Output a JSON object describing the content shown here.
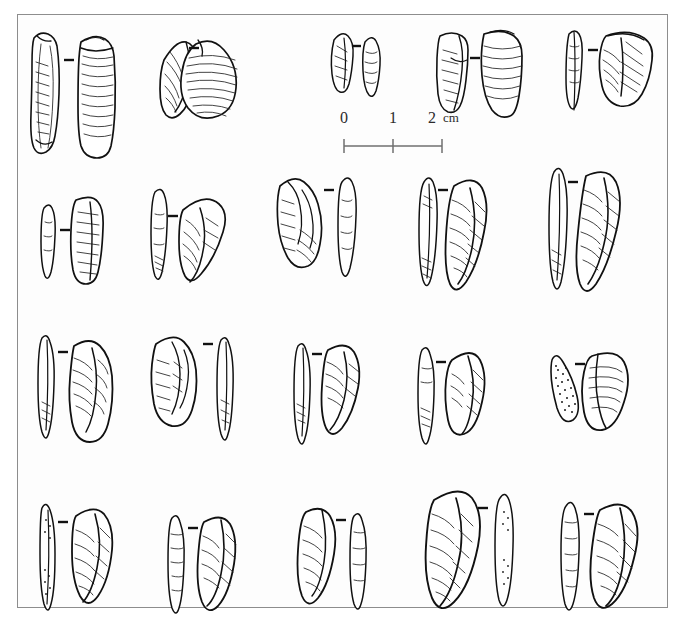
{
  "figure": {
    "type": "archaeological-lithic-plate",
    "title": "",
    "caption": "",
    "background_color": "#ffffff",
    "frame_color": "#8d8d8d",
    "ink_color": "#111111",
    "view_separator_glyph": "–",
    "rows": 4
  },
  "scale_bar": {
    "labels": [
      "0",
      "1",
      "2"
    ],
    "unit": "cm",
    "total_cm": 2,
    "tick_count": 3,
    "orientation": "horizontal"
  },
  "artifacts": [
    {
      "row": 1,
      "index": 1,
      "name": "blade-core-fragment",
      "views": [
        "lateral",
        "dorsal"
      ],
      "separator": "–",
      "texture": [
        "ripple-hatching",
        "retouch-scars"
      ]
    },
    {
      "row": 1,
      "index": 2,
      "name": "broad-flake",
      "views": [
        "lateral",
        "ventral"
      ],
      "separator": "–",
      "texture": [
        "concentric-ripples",
        "dorsal-ridges"
      ]
    },
    {
      "row": 1,
      "index": 3,
      "name": "small-flake",
      "views": [
        "dorsal",
        "profile"
      ],
      "separator": "–",
      "texture": [
        "fine-hatching"
      ]
    },
    {
      "row": 1,
      "index": 4,
      "name": "rectangular-flake",
      "views": [
        "dorsal",
        "ventral"
      ],
      "separator": "–",
      "texture": [
        "horizontal-ripples",
        "platform-scar"
      ]
    },
    {
      "row": 1,
      "index": 5,
      "name": "backed-flake",
      "views": [
        "profile",
        "dorsal"
      ],
      "separator": "–",
      "texture": [
        "radial-hatching",
        "retouch-edge"
      ]
    },
    {
      "row": 2,
      "index": 1,
      "name": "narrow-bladelet",
      "views": [
        "profile",
        "dorsal"
      ],
      "separator": "–",
      "texture": [
        "lateral-hatching"
      ]
    },
    {
      "row": 2,
      "index": 2,
      "name": "triangular-point",
      "views": [
        "profile",
        "dorsal"
      ],
      "separator": "–",
      "texture": [
        "cortex-stipple",
        "ridge-hatching"
      ]
    },
    {
      "row": 2,
      "index": 3,
      "name": "stepped-flake",
      "views": [
        "dorsal",
        "profile"
      ],
      "separator": "–",
      "texture": [
        "step-fracture",
        "ripple-hatching"
      ]
    },
    {
      "row": 2,
      "index": 4,
      "name": "curved-backed-blade",
      "views": [
        "profile",
        "dorsal"
      ],
      "separator": "–",
      "texture": [
        "fine-hatching",
        "backing-retouch"
      ]
    },
    {
      "row": 2,
      "index": 5,
      "name": "elongated-backed-blade",
      "views": [
        "profile",
        "dorsal"
      ],
      "separator": "–",
      "texture": [
        "dense-hatching",
        "backing-retouch"
      ]
    },
    {
      "row": 3,
      "index": 1,
      "name": "pointed-blade",
      "views": [
        "profile",
        "dorsal"
      ],
      "separator": "–",
      "texture": [
        "ridge-hatching",
        "cortex-stipple"
      ]
    },
    {
      "row": 3,
      "index": 2,
      "name": "angular-flake",
      "views": [
        "dorsal",
        "profile"
      ],
      "separator": "–",
      "texture": [
        "scar-hatching"
      ]
    },
    {
      "row": 3,
      "index": 3,
      "name": "slender-point",
      "views": [
        "profile",
        "dorsal"
      ],
      "separator": "–",
      "texture": [
        "diagonal-hatching"
      ]
    },
    {
      "row": 3,
      "index": 4,
      "name": "triangular-backed-piece",
      "views": [
        "profile",
        "dorsal"
      ],
      "separator": "–",
      "texture": [
        "denticulate-edge",
        "oblique-hatching"
      ]
    },
    {
      "row": 3,
      "index": 5,
      "name": "cortex-backed-triangle",
      "views": [
        "stippled-face",
        "dorsal"
      ],
      "separator": "–",
      "texture": [
        "heavy-stipple",
        "fan-hatching"
      ]
    },
    {
      "row": 4,
      "index": 1,
      "name": "elongate-point",
      "views": [
        "profile",
        "dorsal"
      ],
      "separator": "–",
      "texture": [
        "cortex-stipple",
        "ridge-hatching"
      ]
    },
    {
      "row": 4,
      "index": 2,
      "name": "short-triangle-point",
      "views": [
        "profile",
        "dorsal"
      ],
      "separator": "–",
      "texture": [
        "cortex-stipple",
        "oblique-hatching"
      ]
    },
    {
      "row": 4,
      "index": 3,
      "name": "asymmetric-point",
      "views": [
        "dorsal",
        "profile"
      ],
      "separator": "–",
      "texture": [
        "fine-hatching"
      ]
    },
    {
      "row": 4,
      "index": 4,
      "name": "large-backed-blade",
      "views": [
        "dorsal",
        "profile"
      ],
      "separator": "–",
      "texture": [
        "dense-hatching",
        "cortex-stipple"
      ]
    },
    {
      "row": 4,
      "index": 5,
      "name": "backed-point",
      "views": [
        "profile",
        "dorsal"
      ],
      "separator": "–",
      "texture": [
        "ridge-hatching",
        "backing-retouch"
      ]
    }
  ]
}
